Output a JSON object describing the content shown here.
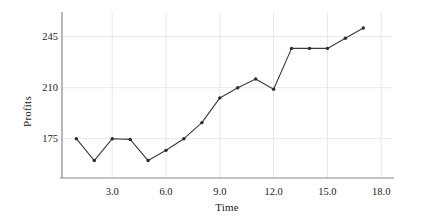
{
  "chart_data": {
    "type": "line",
    "title": "",
    "xlabel": "Time",
    "ylabel": "Profits",
    "grid": true,
    "legend": "none",
    "marker": "filled-circle",
    "line_color": "#3c3c3c",
    "marker_color": "#2b2b2b",
    "grid_color": "#e8e8ec",
    "axis_color": "#8a8a8a",
    "xlim": [
      0.2,
      18.6
    ],
    "ylim": [
      148,
      262
    ],
    "xticks": [
      3.0,
      6.0,
      9.0,
      12.0,
      15.0,
      18.0
    ],
    "xtick_labels": [
      "3.0",
      "6.0",
      "9.0",
      "12.0",
      "15.0",
      "18.0"
    ],
    "yticks": [
      175,
      210,
      245
    ],
    "ytick_labels": [
      "175",
      "210",
      "245"
    ],
    "x": [
      1,
      2,
      3,
      4,
      5,
      6,
      7,
      8,
      9,
      10,
      11,
      12,
      13,
      14,
      15,
      16,
      17
    ],
    "values": [
      175,
      160,
      175,
      174.5,
      160,
      167,
      175,
      186,
      203,
      210,
      216,
      209,
      237,
      237,
      237,
      244,
      251
    ],
    "series": [
      {
        "name": "Profits",
        "values": [
          175,
          160,
          175,
          174.5,
          160,
          167,
          175,
          186,
          203,
          210,
          216,
          209,
          237,
          237,
          237,
          244,
          251
        ]
      }
    ]
  }
}
